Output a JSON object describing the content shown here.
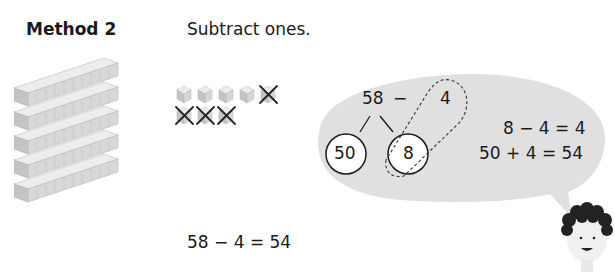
{
  "method": {
    "title": "Method 2"
  },
  "instruction": "Subtract ones.",
  "base_ten": {
    "tens_rods": 5,
    "ones_cubes": 8,
    "ones_crossed_out": 4
  },
  "bubble": {
    "expression_left": "58",
    "operator": "−",
    "expression_right": "4",
    "partition": [
      "50",
      "8"
    ],
    "step1": "8 − 4 = 4",
    "step2": "50 + 4 = 54"
  },
  "final_equation": "58 − 4 = 54",
  "colors": {
    "bubble_fill": "#e0e0e0",
    "cube_face": "#cfcfcf",
    "text": "#1a1a1a"
  }
}
